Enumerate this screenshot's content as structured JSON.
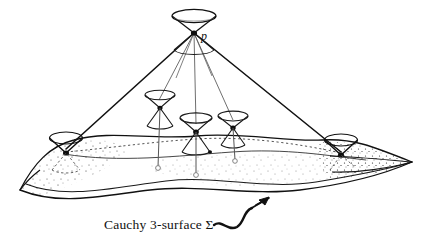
{
  "figure": {
    "caption": "Cauchy 3-surface Σ",
    "apex_label": "p",
    "background_color": "#ffffff",
    "ink_color": "#111111",
    "stipple_color": "#2b2b2b"
  },
  "apex": {
    "name": "p",
    "label": "p",
    "x": 194,
    "y": 33,
    "upper_cone": {
      "rim_cx": 194,
      "rim_cy": 16,
      "rim_rx": 22,
      "rim_ry": 6.5
    },
    "lower_cone_stub": {
      "rim_cx": 194,
      "rim_cy": 50,
      "rim_rx": 20,
      "rim_ry": 5.5
    }
  },
  "past_light_cone": {
    "left_generator": {
      "x1": 194,
      "y1": 33,
      "x2": 66,
      "y2": 149
    },
    "right_generator": {
      "x1": 194,
      "y1": 33,
      "x2": 341,
      "y2": 152
    },
    "interior_generators": [
      {
        "x1": 194,
        "y1": 33,
        "x2": 160,
        "y2": 99
      },
      {
        "x1": 194,
        "y1": 33,
        "x2": 196,
        "y2": 117
      },
      {
        "x1": 194,
        "y1": 33,
        "x2": 232,
        "y2": 114
      },
      {
        "x1": 194,
        "y1": 33,
        "x2": 178,
        "y2": 92
      },
      {
        "x1": 194,
        "y1": 33,
        "x2": 214,
        "y2": 95
      }
    ]
  },
  "light_cones": [
    {
      "name": "cone-interior-left",
      "x": 160,
      "y": 107,
      "rx": 15,
      "ry": 5.0,
      "h": 17,
      "below_h": 19,
      "drop_to_y": 167
    },
    {
      "name": "cone-interior-center",
      "x": 196,
      "y": 131,
      "rx": 16,
      "ry": 5.2,
      "h": 18,
      "below_h": 22,
      "drop_to_y": 174
    },
    {
      "name": "cone-interior-right",
      "x": 233,
      "y": 127,
      "rx": 15,
      "ry": 5.0,
      "h": 16,
      "below_h": 19,
      "drop_to_y": 160
    },
    {
      "name": "cone-edge-left",
      "x": 66,
      "y": 149,
      "rx": 16,
      "ry": 6.0,
      "h": 18,
      "below_h": 18,
      "drop_to_y": 0
    },
    {
      "name": "cone-edge-right",
      "x": 341,
      "y": 152,
      "rx": 16,
      "ry": 6.0,
      "h": 17,
      "below_h": 17,
      "drop_to_y": 0
    }
  ],
  "surface": {
    "name": "Cauchy 3-surface",
    "symbol": "Σ",
    "top_edge": "M 20,190 C 34,163 50,146 74,140 C 110,130 150,140 196,136 C 244,132 286,142 322,140 C 352,138 372,146 412,162",
    "bottom_edge": "M 20,190 C 60,206 100,196 150,190 C 200,184 250,196 300,190 C 340,185 380,176 412,162",
    "fold_line": "M 30,182 C 70,200 120,186 170,181 C 220,176 270,190 320,182 C 356,176 386,170 412,162",
    "dashed_horizon": "M 66,150 C 110,146 150,141 196,138 C 244,135 296,142 341,152",
    "left_tip": {
      "x": 20,
      "y": 190
    },
    "right_tip": {
      "x": 412,
      "y": 162
    }
  },
  "annotation": {
    "arrow_label": "Cauchy 3-surface Σ",
    "label_x": 104,
    "label_y": 226,
    "squiggle_path": "M 212,226 C 222,222 226,232 236,228 C 244,225 244,215 253,212",
    "arrow_head": {
      "tip_x": 268,
      "tip_y": 203
    }
  }
}
